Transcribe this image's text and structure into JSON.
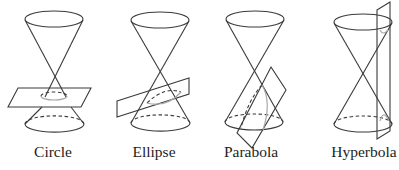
{
  "diagram": {
    "panels": [
      {
        "id": "circle",
        "label": "Circle"
      },
      {
        "id": "ellipse",
        "label": "Ellipse"
      },
      {
        "id": "parabola",
        "label": "Parabola"
      },
      {
        "id": "hyperbola",
        "label": "Hyperbola"
      }
    ],
    "colors": {
      "stroke": "#3a3a3a",
      "section_curve": "#a8a8a8",
      "background": "#ffffff"
    }
  }
}
